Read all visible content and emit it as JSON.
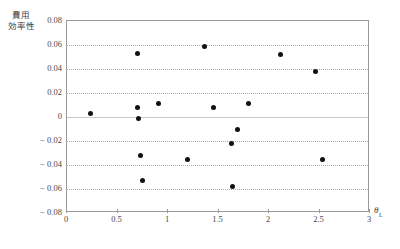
{
  "figure": {
    "title_faint": "",
    "background_color": "#ffffff",
    "point_color": "#111111",
    "frame_color": "#9a9a9a",
    "gridline_color": "#9d9db5"
  },
  "chart_data": {
    "type": "scatter",
    "title": "",
    "xlabel": "θ L",
    "xlabel_base": "θ",
    "xlabel_sub": "L",
    "ylabel": "費用効率性",
    "ylabel_line1": "費用",
    "ylabel_line2": "効率性",
    "xlim": [
      0,
      3
    ],
    "ylim": [
      -0.08,
      0.08
    ],
    "xticks": [
      "0",
      "0.5",
      "1",
      "1.5",
      "2",
      "2.5",
      "3"
    ],
    "xtick_values": [
      0,
      0.5,
      1,
      1.5,
      2,
      2.5,
      3
    ],
    "yticks": [
      "0.08",
      "0.06",
      "0.04",
      "0.02",
      "0",
      "− 0.02",
      "− 0.04",
      "− 0.06",
      "− 0.08"
    ],
    "ytick_values": [
      0.08,
      0.06,
      0.04,
      0.02,
      0,
      -0.02,
      -0.04,
      -0.06,
      -0.08
    ],
    "grid": true,
    "legend": null,
    "series": [
      {
        "name": "cost-efficiency",
        "marker": "filled-circle",
        "points": [
          {
            "x": 0.23,
            "y": 0.003
          },
          {
            "x": 0.7,
            "y": 0.053
          },
          {
            "x": 0.7,
            "y": 0.008
          },
          {
            "x": 0.71,
            "y": -0.001
          },
          {
            "x": 0.73,
            "y": -0.032
          },
          {
            "x": 0.75,
            "y": -0.053
          },
          {
            "x": 0.91,
            "y": 0.011
          },
          {
            "x": 1.19,
            "y": -0.035
          },
          {
            "x": 1.36,
            "y": 0.059
          },
          {
            "x": 1.45,
            "y": 0.008
          },
          {
            "x": 1.63,
            "y": -0.022
          },
          {
            "x": 1.64,
            "y": -0.058
          },
          {
            "x": 1.69,
            "y": -0.01
          },
          {
            "x": 1.8,
            "y": 0.011
          },
          {
            "x": 2.11,
            "y": 0.052
          },
          {
            "x": 2.46,
            "y": 0.038
          },
          {
            "x": 2.53,
            "y": -0.035
          }
        ]
      }
    ]
  }
}
